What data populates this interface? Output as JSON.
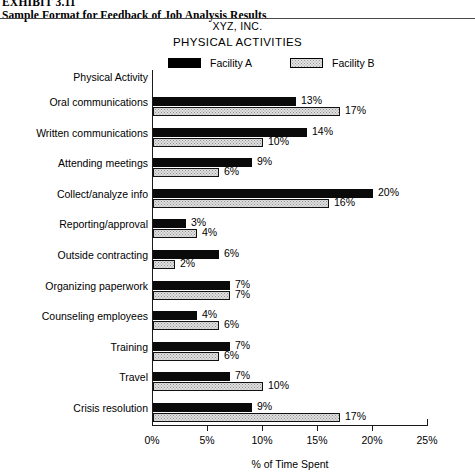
{
  "exhibit": {
    "number": "EXHIBIT 3.11",
    "title": "Sample Format for Feedback of Job Analysis Results"
  },
  "chart_titles": {
    "company": "XYZ, INC.",
    "main": "PHYSICAL ACTIVITIES"
  },
  "legend": {
    "series_a_label": "Facility A",
    "series_b_label": "Facility B",
    "series_a_swatch": "solid-black-swatch-icon",
    "series_b_swatch": "dotted-gray-swatch-icon"
  },
  "category_header": "Physical Activity",
  "chart_data": {
    "type": "bar",
    "orientation": "horizontal",
    "title": "PHYSICAL ACTIVITIES",
    "subtitle": "XYZ, INC.",
    "xlabel": "% of Time Spent",
    "ylabel": "Physical Activity",
    "xlim": [
      0,
      25
    ],
    "xticks": [
      0,
      5,
      10,
      15,
      20,
      25
    ],
    "xtick_labels": [
      "0%",
      "5%",
      "10%",
      "15%",
      "20%",
      "25%"
    ],
    "grid": false,
    "legend_position": "top",
    "categories": [
      "Oral communications",
      "Written communications",
      "Attending meetings",
      "Collect/analyze info",
      "Reporting/approval",
      "Outside contracting",
      "Organizing paperwork",
      "Counseling employees",
      "Training",
      "Travel",
      "Crisis resolution"
    ],
    "series": [
      {
        "name": "Facility A",
        "values": [
          13,
          14,
          9,
          20,
          3,
          6,
          7,
          4,
          7,
          7,
          9
        ],
        "value_labels": [
          "13%",
          "14%",
          "9%",
          "20%",
          "3%",
          "6%",
          "7%",
          "4%",
          "7%",
          "7%",
          "9%"
        ],
        "color": "#000000"
      },
      {
        "name": "Facility B",
        "values": [
          17,
          10,
          6,
          16,
          4,
          2,
          7,
          6,
          6,
          10,
          17
        ],
        "value_labels": [
          "17%",
          "10%",
          "6%",
          "16%",
          "4%",
          "2%",
          "7%",
          "6%",
          "6%",
          "10%",
          "17%"
        ],
        "color": "#e0e0e0"
      }
    ]
  }
}
